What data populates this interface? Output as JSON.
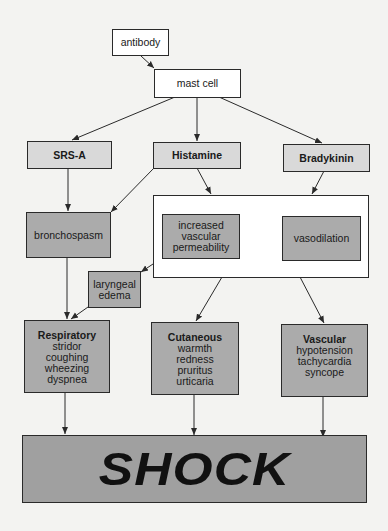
{
  "nodes": {
    "antibody": "antibody",
    "mast_cell": "mast cell",
    "srs_a": "SRS-A",
    "histamine": "Histamine",
    "bradykinin": "Bradykinin",
    "bronchospasm": "bronchospasm",
    "increased_vascular_permeability": [
      "increased",
      "vascular",
      "permeability"
    ],
    "vasodilation": "vasodilation",
    "laryngeal_edema": [
      "laryngeal",
      "edema"
    ],
    "respiratory": {
      "title": "Respiratory",
      "items": [
        "stridor",
        "coughing",
        "wheezing",
        "dyspnea"
      ]
    },
    "cutaneous": {
      "title": "Cutaneous",
      "items": [
        "warmth",
        "redness",
        "pruritus",
        "urticaria"
      ]
    },
    "vascular": {
      "title": "Vascular",
      "items": [
        "hypotension",
        "tachycardia",
        "syncope"
      ]
    },
    "shock": "SHOCK"
  },
  "edges": [
    [
      "antibody",
      "mast_cell"
    ],
    [
      "mast_cell",
      "srs_a"
    ],
    [
      "mast_cell",
      "histamine"
    ],
    [
      "mast_cell",
      "bradykinin"
    ],
    [
      "srs_a",
      "bronchospasm"
    ],
    [
      "histamine",
      "bronchospasm"
    ],
    [
      "histamine",
      "vascular_effects_group"
    ],
    [
      "bradykinin",
      "vascular_effects_group"
    ],
    [
      "increased_vascular_permeability",
      "laryngeal_edema"
    ],
    [
      "bronchospasm",
      "respiratory"
    ],
    [
      "laryngeal_edema",
      "respiratory"
    ],
    [
      "vascular_effects_group",
      "cutaneous"
    ],
    [
      "vascular_effects_group",
      "vascular"
    ],
    [
      "respiratory",
      "shock"
    ],
    [
      "cutaneous",
      "shock"
    ],
    [
      "vascular",
      "shock"
    ]
  ],
  "colors": {
    "background": "#f3f3f1",
    "light_box": "#d9d9d9",
    "mid_box": "#ababab",
    "shock_box": "#a0a0a0",
    "line": "#2a2a2a"
  }
}
